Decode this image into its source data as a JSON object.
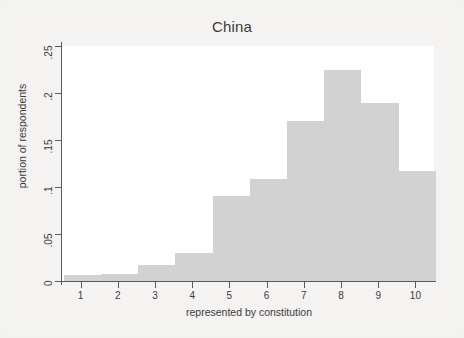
{
  "chart_data": {
    "type": "bar",
    "title": "China",
    "xlabel": "represented by constitution",
    "ylabel": "portion of respondents",
    "grid": false,
    "legend": null,
    "xlim": [
      0.5,
      10.5
    ],
    "ylim": [
      0,
      0.25
    ],
    "x_ticks": [
      "1",
      "2",
      "3",
      "4",
      "5",
      "6",
      "7",
      "8",
      "9",
      "10"
    ],
    "y_ticks": [
      "0",
      ".05",
      ".1",
      ".15",
      ".2",
      ".25"
    ],
    "y_tick_values": [
      0,
      0.05,
      0.1,
      0.15,
      0.2,
      0.25
    ],
    "bar_color": "#d2d2d2",
    "categories": [
      "1",
      "2",
      "3",
      "4",
      "5",
      "6",
      "7",
      "8",
      "9",
      "10"
    ],
    "values": [
      0.006,
      0.006,
      0.016,
      0.03,
      0.09,
      0.108,
      0.17,
      0.224,
      0.189,
      0.117
    ],
    "bins": [
      {
        "center": 0.5,
        "value": 0.006
      },
      {
        "center": 1.0,
        "value": 0.006
      },
      {
        "center": 1.5,
        "value": 0.006
      },
      {
        "center": 2.0,
        "value": 0.006
      },
      {
        "center": 2.5,
        "value": 0.006
      },
      {
        "center": 3.0,
        "value": 0.016
      },
      {
        "center": 3.5,
        "value": 0.016
      },
      {
        "center": 4.0,
        "value": 0.03
      },
      {
        "center": 4.5,
        "value": 0.03
      },
      {
        "center": 5.0,
        "value": 0.09
      },
      {
        "center": 5.5,
        "value": 0.09
      },
      {
        "center": 6.0,
        "value": 0.108
      },
      {
        "center": 6.5,
        "value": 0.108
      },
      {
        "center": 7.0,
        "value": 0.17
      },
      {
        "center": 7.5,
        "value": 0.17
      },
      {
        "center": 8.0,
        "value": 0.224
      },
      {
        "center": 8.5,
        "value": 0.224
      },
      {
        "center": 9.0,
        "value": 0.189
      },
      {
        "center": 9.5,
        "value": 0.189
      },
      {
        "center": 10.0,
        "value": 0.117
      }
    ],
    "bar_segments": [
      {
        "label": "bar-1",
        "x_start": 0.55,
        "x_end": 1.55,
        "value": 0.006
      },
      {
        "label": "bar-2",
        "x_start": 1.55,
        "x_end": 2.55,
        "value": 0.007
      },
      {
        "label": "bar-3",
        "x_start": 2.55,
        "x_end": 3.55,
        "value": 0.017
      },
      {
        "label": "bar-4",
        "x_start": 3.55,
        "x_end": 4.55,
        "value": 0.03
      },
      {
        "label": "bar-5",
        "x_start": 4.55,
        "x_end": 5.55,
        "value": 0.09
      },
      {
        "label": "bar-6",
        "x_start": 5.55,
        "x_end": 6.55,
        "value": 0.108
      },
      {
        "label": "bar-7",
        "x_start": 6.55,
        "x_end": 7.55,
        "value": 0.17
      },
      {
        "label": "bar-8",
        "x_start": 7.55,
        "x_end": 8.55,
        "value": 0.224
      },
      {
        "label": "bar-9",
        "x_start": 8.55,
        "x_end": 9.55,
        "value": 0.189
      },
      {
        "label": "bar-10",
        "x_start": 9.55,
        "x_end": 10.55,
        "value": 0.117
      }
    ]
  }
}
